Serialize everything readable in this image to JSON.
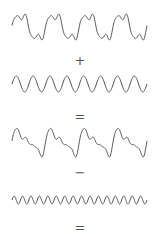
{
  "diagram": {
    "stroke_color": "#555555",
    "background": "#ffffff",
    "rows": [
      {
        "kind": "wave",
        "name": "complex-wave-a",
        "description": "fundamental + harmonic, 4 cycles",
        "y_center": 27,
        "amp": 13,
        "cycles": 4,
        "harmonics": [
          [
            1,
            1.0,
            0
          ],
          [
            3,
            0.35,
            0
          ],
          [
            5,
            0.12,
            0.5
          ]
        ]
      },
      {
        "kind": "operator",
        "symbol": "+",
        "y": 61
      },
      {
        "kind": "wave",
        "name": "sine-wave-8",
        "description": "pure sine, 8 cycles",
        "y_center": 84,
        "amp": 8,
        "cycles": 8,
        "harmonics": [
          [
            1,
            1.0,
            0
          ]
        ]
      },
      {
        "kind": "operator",
        "symbol": "=",
        "y": 117
      },
      {
        "kind": "wave",
        "name": "sum-wave",
        "description": "result of addition",
        "y_center": 142,
        "amp": 15,
        "cycles": 4,
        "harmonics": [
          [
            1,
            1.0,
            0
          ],
          [
            2,
            0.55,
            0
          ],
          [
            3,
            0.35,
            0
          ],
          [
            5,
            0.12,
            0.5
          ]
        ]
      },
      {
        "kind": "operator",
        "symbol": "−",
        "y": 173
      },
      {
        "kind": "wave",
        "name": "sine-wave-16",
        "description": "pure sine, 16 cycles",
        "y_center": 200,
        "amp": 4,
        "cycles": 16,
        "harmonics": [
          [
            1,
            1.0,
            0
          ]
        ]
      },
      {
        "kind": "operator",
        "symbol": "=",
        "y": 228
      }
    ],
    "x_start": 12,
    "x_end": 147
  },
  "operators": {
    "plus": "+",
    "equals1": "=",
    "minus": "−",
    "equals2": "="
  }
}
